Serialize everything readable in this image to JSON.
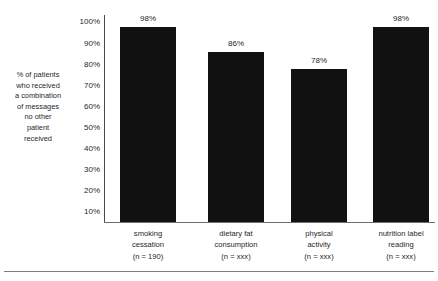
{
  "chart_data": {
    "type": "bar",
    "title": "",
    "xlabel": "",
    "ylabel": "% of patients who received a combination of messages no other patient received",
    "ylim": [
      10,
      100
    ],
    "grid": false,
    "legend": "none",
    "categories": [
      "smoking cessation (n = 190)",
      "dietary fat consumption (n = xxx)",
      "physical activity (n = xxx)",
      "nutrition label reading (n = xxx)"
    ],
    "values": [
      98,
      86,
      78,
      98
    ],
    "value_labels": [
      "98%",
      "86%",
      "78%",
      "98%"
    ],
    "ytick_labels": [
      "100%",
      "90%",
      "80%",
      "70%",
      "60%",
      "50%",
      "40%",
      "30%",
      "20%",
      "10%"
    ],
    "ytick_values": [
      100,
      90,
      80,
      70,
      60,
      50,
      40,
      30,
      20,
      10
    ],
    "bar_color": "#111111",
    "axis_color": "#6d6d6d"
  },
  "y_axis_title_lines": [
    "% of patients",
    "who received",
    "a combination",
    "of messages",
    "no other",
    "patient",
    "received"
  ],
  "category_labels": [
    {
      "line1": "smoking",
      "line2": "cessation",
      "line3": "(n = 190)"
    },
    {
      "line1": "dietary fat",
      "line2": "consumption",
      "line3": "(n = xxx)"
    },
    {
      "line1": "physical",
      "line2": "activity",
      "line3": "(n = xxx)"
    },
    {
      "line1": "nutrition label",
      "line2": "reading",
      "line3": "(n = xxx)"
    }
  ]
}
